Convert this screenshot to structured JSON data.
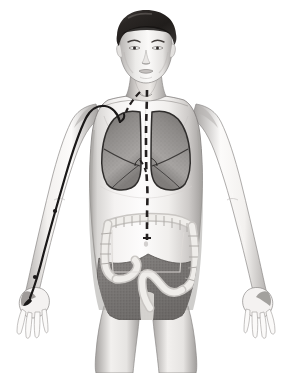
{
  "illustration": {
    "title": "Anterior view of human torso anatomy",
    "subject": "male figure, frontal view, head to mid-thigh",
    "background_color": "#ffffff",
    "style": "grayscale medical illustration, airbrushed shading"
  },
  "figure": {
    "skin_tone": "#f2f0ee",
    "skin_shadow": "#b9b6b4",
    "skin_deep_shadow": "#8f8c8a",
    "outline_color": "#6e6b69",
    "hair_color": "#2b2826",
    "hair_highlight": "#6a6562"
  },
  "organs": {
    "lungs": {
      "label": "lungs",
      "fill": "#8d8a88",
      "fill_light": "#b5b2b0",
      "outline": "#2e2c2b",
      "description": "paired shaded lung fields in the thoracic cavity with fissure lines"
    },
    "colon": {
      "label": "large intestine (colon)",
      "fill": "#dcdad7",
      "outline": "#9a9795",
      "description": "haustrated frame of ascending, transverse, descending and sigmoid colon"
    },
    "pelvic_mass": {
      "label": "pelvic and lower abdominal viscera",
      "fill": "#7e7b79",
      "outline": "#5c5957",
      "description": "dark stippled mass filling the lower abdomen and pelvis"
    }
  },
  "overlays": {
    "midline_path": {
      "label": "dashed midline pathway",
      "color": "#231f1f",
      "style": "dashed",
      "dash_pattern": "7 5",
      "stroke_width": 2.6,
      "route": "from throat/neck, down the mediastinum between the lungs, through the upper abdomen, ending at the transverse colon"
    },
    "branch_path": {
      "label": "dashed branch toward left lung apex",
      "color": "#231f1f",
      "style": "dashed",
      "dash_pattern": "6 4",
      "stroke_width": 2.2,
      "route": "short oblique dashed segment from the neck toward the right-side lung apex"
    },
    "arm_line": {
      "label": "catheter line along the left arm",
      "color": "#1a1818",
      "style": "solid",
      "stroke_width": 2.2,
      "route": "curves over the shoulder, runs down the lateral arm and forearm, terminates at the thumb web of the hand",
      "node_count": 2,
      "node_color": "#1a1818",
      "tip_marker": "filled teardrop at the hand"
    }
  },
  "regions": [
    {
      "name": "head",
      "label": "head and face"
    },
    {
      "name": "neck",
      "label": "neck"
    },
    {
      "name": "shoulders",
      "label": "shoulders and clavicles"
    },
    {
      "name": "chest",
      "label": "chest / thorax"
    },
    {
      "name": "abdomen",
      "label": "abdomen"
    },
    {
      "name": "pelvis",
      "label": "pelvis"
    },
    {
      "name": "left-arm",
      "label": "left arm"
    },
    {
      "name": "right-arm",
      "label": "right arm"
    },
    {
      "name": "left-hand",
      "label": "left hand"
    },
    {
      "name": "right-hand",
      "label": "right hand"
    },
    {
      "name": "thighs",
      "label": "upper thighs"
    }
  ]
}
